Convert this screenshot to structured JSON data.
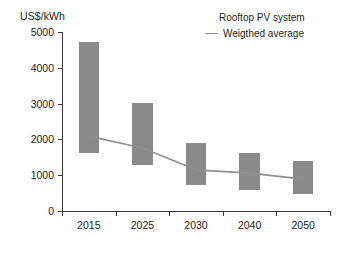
{
  "axes": {
    "y_title": "US$/kWh",
    "y_ticks": [
      "5000",
      "4000",
      "3000",
      "2000",
      "1000",
      "0"
    ],
    "x_ticks": [
      "2015",
      "2025",
      "2030",
      "2040",
      "2050"
    ]
  },
  "legend": {
    "title": "Rooftop PV system",
    "series_label": "Weigthed average",
    "line_color": "#8f8f8f",
    "bar_color": "#8a8a8a"
  },
  "chart_data": {
    "type": "bar",
    "title": "",
    "subtitle": "",
    "xlabel": "",
    "ylabel": "US$/kWh",
    "ylim": [
      0,
      5000
    ],
    "ytick_values": [
      0,
      1000,
      2000,
      3000,
      4000,
      5000
    ],
    "grid": false,
    "legend_position": "top-right",
    "legend_title": "Rooftop PV system",
    "categories": [
      "2015",
      "2025",
      "2030",
      "2040",
      "2050"
    ],
    "series": [
      {
        "name": "Cost range",
        "type": "range-bar",
        "color": "#8a8a8a",
        "low": [
          1620,
          1285,
          730,
          590,
          475
        ],
        "high": [
          4720,
          3020,
          1900,
          1620,
          1400
        ]
      },
      {
        "name": "Weigthed average",
        "type": "line",
        "color": "#8f8f8f",
        "values": [
          2090,
          1760,
          1150,
          1060,
          890
        ]
      }
    ],
    "units": "US$/kWh",
    "annotations": []
  }
}
